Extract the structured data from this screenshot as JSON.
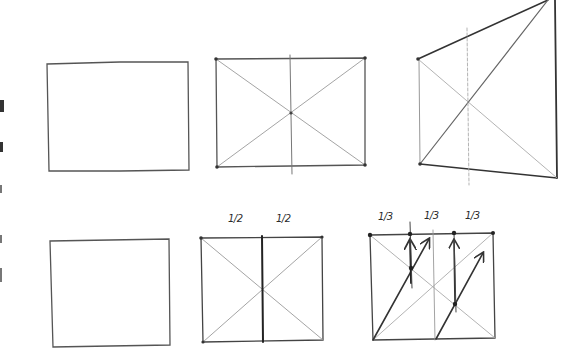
{
  "diagram": {
    "type": "hand-drawn perspective construction sketches",
    "colors": {
      "paper": "#ffffff",
      "pencil_dark": "#3a3a3a",
      "pencil_light": "#a8a8a8"
    },
    "rows": [
      {
        "frames": [
          {
            "id": "rect-plain-top",
            "description": "plain rectangle"
          },
          {
            "id": "rect-diagonals-center",
            "description": "rectangle with diagonals and vertical center line"
          },
          {
            "id": "rect-perspective",
            "description": "rectangle in perspective with diagonals and center line"
          }
        ]
      },
      {
        "frames": [
          {
            "id": "rect-plain-bottom",
            "description": "plain rectangle"
          },
          {
            "id": "rect-halves",
            "description": "rectangle divided into halves",
            "labels": [
              "1/2",
              "1/2"
            ]
          },
          {
            "id": "rect-thirds",
            "description": "rectangle divided into thirds with arrows",
            "labels": [
              "1/3",
              "1/3",
              "1/3"
            ]
          }
        ]
      }
    ]
  }
}
